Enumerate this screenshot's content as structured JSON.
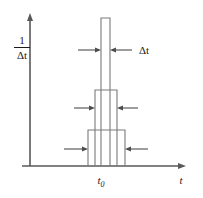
{
  "figure": {
    "name": "delta-function-limit-diagram",
    "background_color": "#ffffff",
    "axis_color": "#595959",
    "pulse_color": "#7a7a7a",
    "arrow_color": "#4d4d4d",
    "text_color": "#1a1a1a"
  },
  "axes": {
    "y_label_numerator": "1",
    "y_label_denominator": "Δt",
    "x_label": "t",
    "x_tick_label": "t",
    "x_tick_subscript": "0",
    "y_axis": {
      "x": 30,
      "top": 18,
      "bottom": 166
    },
    "x_axis": {
      "y": 166,
      "left": 22,
      "right": 186
    }
  },
  "annotations": {
    "width_label": "Δt"
  },
  "chart_data": {
    "type": "bar",
    "title": "",
    "xlabel": "t",
    "ylabel": "1/Δt",
    "center": "t0",
    "grid": false,
    "legend": false,
    "pulses": [
      {
        "name": "widest-pulse",
        "left": 88,
        "right": 125,
        "top": 130,
        "baseline": 166,
        "width_px": 37,
        "height_px": 36,
        "order": 1
      },
      {
        "name": "middle-pulse",
        "left": 95,
        "right": 117,
        "top": 90,
        "baseline": 166,
        "width_px": 22,
        "height_px": 76,
        "order": 2
      },
      {
        "name": "narrowest-pulse",
        "left": 101,
        "right": 110,
        "top": 18,
        "baseline": 166,
        "width_px": 9,
        "height_px": 148,
        "order": 3
      }
    ],
    "dimension_markers": [
      {
        "name": "narrow-pulse-width-marker",
        "y": 50,
        "left_arrow_from": 78,
        "left_arrow_to": 100,
        "right_arrow_from": 132,
        "right_arrow_to": 111,
        "label": "Δt",
        "label_x": 138
      },
      {
        "name": "middle-pulse-width-marker",
        "y": 108,
        "left_arrow_from": 74,
        "left_arrow_to": 94,
        "right_arrow_from": 138,
        "right_arrow_to": 118,
        "label": "",
        "label_x": 0
      },
      {
        "name": "wide-pulse-width-marker",
        "y": 149,
        "left_arrow_from": 64,
        "left_arrow_to": 87,
        "right_arrow_from": 148,
        "right_arrow_to": 126,
        "label": "",
        "label_x": 0
      }
    ]
  }
}
